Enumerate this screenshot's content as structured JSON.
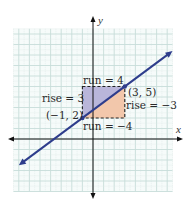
{
  "chart_data": {
    "type": "line",
    "title": "",
    "xlabel": "x",
    "ylabel": "y",
    "xlim": [
      -7.5,
      7.5
    ],
    "ylim": [
      -5,
      10.5
    ],
    "grid": true,
    "line": {
      "slope": 0.75,
      "intercept": 2.75,
      "x_range": [
        -7,
        7.5
      ],
      "color": "#2e3d8c"
    },
    "points": [
      {
        "x": -1,
        "y": 2,
        "label": "(−1, 2)"
      },
      {
        "x": 3,
        "y": 5,
        "label": "(3, 5)"
      }
    ],
    "triangles": [
      {
        "name": "upper-left",
        "vertices": [
          [
            -1,
            2
          ],
          [
            -1,
            5
          ],
          [
            3,
            5
          ]
        ],
        "color": "#b9b6da"
      },
      {
        "name": "lower-right",
        "vertices": [
          [
            -1,
            2
          ],
          [
            3,
            2
          ],
          [
            3,
            5
          ]
        ],
        "color": "#f2c7ab"
      }
    ],
    "annotations": {
      "run_top": "run = 4",
      "rise_left": "rise = 3",
      "rise_right": "rise = −3",
      "run_bottom": "run = −4"
    }
  },
  "colors": {
    "grid_major": "#c7dcd9",
    "grid_minor": "#dde9e7",
    "grid_bg": "#f6fbfa",
    "axis": "#111111",
    "dash": "#222222"
  }
}
